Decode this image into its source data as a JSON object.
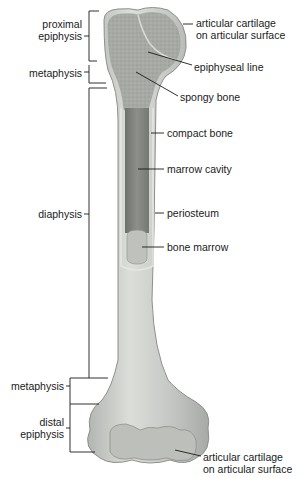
{
  "diagram": {
    "left_labels": {
      "proximal_epiphysis": [
        "proximal",
        "epiphysis"
      ],
      "metaphysis_top": "metaphysis",
      "diaphysis": "diaphysis",
      "metaphysis_bottom": "metaphysis",
      "distal_epiphysis": [
        "distal",
        "epiphysis"
      ]
    },
    "right_labels": {
      "articular_cartilage_top": [
        "articular cartilage",
        "on articular surface"
      ],
      "epiphyseal_line": "epiphyseal line",
      "spongy_bone": "spongy bone",
      "compact_bone": "compact bone",
      "marrow_cavity": "marrow cavity",
      "periosteum": "periosteum",
      "bone_marrow": "bone marrow",
      "articular_cartilage_bottom": [
        "articular cartilage",
        "on articular surface"
      ]
    },
    "colors": {
      "bone_outer": "#c9cbc8",
      "spongy": "#a9aba6",
      "cavity": "#8a8c88",
      "marrow": "#b9bcb6",
      "line": "#1a1a1a"
    }
  }
}
